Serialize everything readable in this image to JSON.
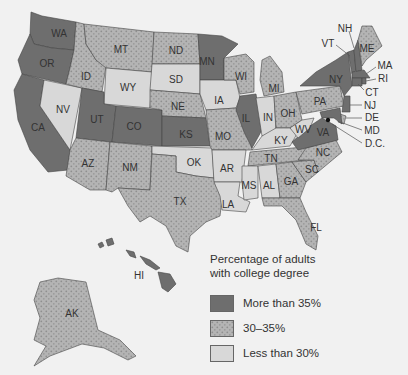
{
  "legend": {
    "title_line1": "Percentage of adults",
    "title_line2": "with college degree",
    "items": [
      {
        "label": "More than 35%",
        "category": "high",
        "color": "#6e6e6e"
      },
      {
        "label": "30–35%",
        "category": "mid",
        "color": "#b4b4b4",
        "pattern": "dotted"
      },
      {
        "label": "Less than 30%",
        "category": "low",
        "color": "#d8d8d8"
      }
    ]
  },
  "colors": {
    "high": "#6e6e6e",
    "mid": "#b4b4b4",
    "mid_dot": "#8f8f8f",
    "low": "#d8d8d8",
    "background": "#f1f1f1",
    "border": "#444444"
  },
  "states": {
    "high": [
      "WA",
      "OR",
      "CA",
      "UT",
      "CO",
      "KS",
      "MN",
      "IL",
      "VA",
      "NY",
      "VT",
      "NH",
      "MA",
      "CT",
      "NJ",
      "MD",
      "RI",
      "HI",
      "D.C."
    ],
    "mid": [
      "MT",
      "ID",
      "ND",
      "NE",
      "AZ",
      "NM",
      "TX",
      "MO",
      "WI",
      "MI",
      "OH",
      "PA",
      "NC",
      "SC",
      "GA",
      "FL",
      "TN",
      "ME",
      "AK",
      "DE"
    ],
    "low": [
      "NV",
      "WY",
      "SD",
      "IA",
      "OK",
      "AR",
      "LA",
      "MS",
      "AL",
      "IN",
      "KY",
      "WV"
    ]
  },
  "labels": {
    "WA": "WA",
    "OR": "OR",
    "CA": "CA",
    "NV": "NV",
    "ID": "ID",
    "MT": "MT",
    "WY": "WY",
    "UT": "UT",
    "CO": "CO",
    "AZ": "AZ",
    "NM": "NM",
    "ND": "ND",
    "SD": "SD",
    "NE": "NE",
    "KS": "KS",
    "OK": "OK",
    "TX": "TX",
    "MN": "MN",
    "IA": "IA",
    "MO": "MO",
    "AR": "AR",
    "LA": "LA",
    "WI": "WI",
    "IL": "IL",
    "MI": "MI",
    "IN": "IN",
    "OH": "OH",
    "KY": "KY",
    "TN": "TN",
    "MS": "MS",
    "AL": "AL",
    "GA": "GA",
    "FL": "FL",
    "SC": "SC",
    "NC": "NC",
    "VA": "VA",
    "WV": "WV",
    "PA": "PA",
    "NY": "NY",
    "VT": "VT",
    "NH": "NH",
    "ME": "ME",
    "MA": "MA",
    "RI": "RI",
    "CT": "CT",
    "NJ": "NJ",
    "DE": "DE",
    "MD": "MD",
    "DC": "D.C.",
    "AK": "AK",
    "HI": "HI"
  }
}
